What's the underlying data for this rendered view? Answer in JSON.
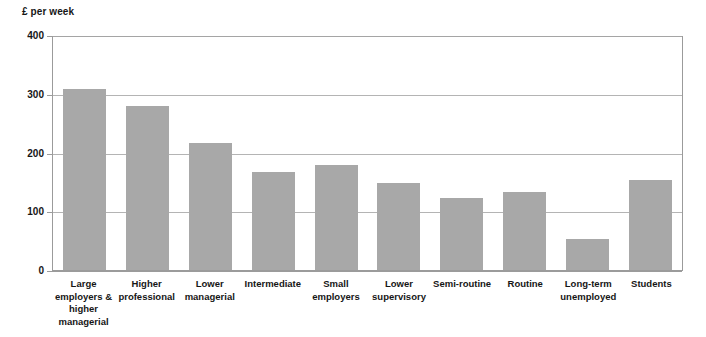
{
  "chart_data": {
    "type": "bar",
    "title": "",
    "subtitle": "",
    "xlabel": "",
    "ylabel": "£ per week",
    "ylim": [
      0,
      400
    ],
    "yticks": [
      0,
      100,
      200,
      300,
      400
    ],
    "grid": true,
    "legend": false,
    "bar_color": "#a8a8a8",
    "categories": [
      "Large employers & higher managerial",
      "Higher professional",
      "Lower managerial",
      "Intermediate",
      "Small employers",
      "Lower supervisory",
      "Semi-routine",
      "Routine",
      "Long-term unemployed",
      "Students"
    ],
    "values": [
      308,
      280,
      216,
      167,
      178,
      148,
      122,
      133,
      52,
      154
    ]
  },
  "axis": {
    "unit_label": "£ per week",
    "tick_labels": [
      "400",
      "300",
      "200",
      "100",
      "0"
    ]
  },
  "categories_display": [
    "Large\nemployers &\nhigher\nmanagerial",
    "Higher\nprofessional",
    "Lower\nmanagerial",
    "Intermediate",
    "Small\nemployers",
    "Lower\nsupervisory",
    "Semi-routine",
    "Routine",
    "Long-term\nunemployed",
    "Students"
  ]
}
